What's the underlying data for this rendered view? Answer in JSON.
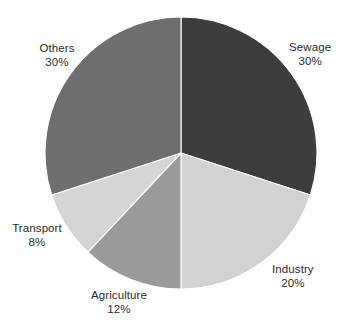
{
  "chart_data": {
    "type": "pie",
    "title": "",
    "subtitle": "",
    "xlabel": "",
    "ylabel": "",
    "legend_position": "none",
    "grid": false,
    "units": "percent",
    "total": 100,
    "start_angle_deg": 0,
    "direction": "clockwise",
    "categories": [
      "Sewage",
      "Industry",
      "Agriculture",
      "Transport",
      "Others"
    ],
    "values": [
      30,
      20,
      12,
      8,
      30
    ],
    "slices": [
      {
        "label": "Sewage",
        "value": 30,
        "value_text": "30%",
        "color": "#3d3d3d",
        "start_deg": 0,
        "end_deg": 108,
        "label_x": 289,
        "label_y": 40,
        "label_anchor": "start"
      },
      {
        "label": "Industry",
        "value": 20,
        "value_text": "20%",
        "color": "#d2d2d2",
        "start_deg": 108,
        "end_deg": 180,
        "label_x": 272,
        "label_y": 262,
        "label_anchor": "start"
      },
      {
        "label": "Agriculture",
        "value": 12,
        "value_text": "12%",
        "color": "#9a9a9a",
        "start_deg": 180,
        "end_deg": 223.2,
        "label_x": 119,
        "label_y": 288,
        "label_anchor": "mid"
      },
      {
        "label": "Transport",
        "value": 8,
        "value_text": "8%",
        "color": "#d5d5d5",
        "start_deg": 223.2,
        "end_deg": 252,
        "label_x": 37,
        "label_y": 221,
        "label_anchor": "mid"
      },
      {
        "label": "Others",
        "value": 30,
        "value_text": "30%",
        "color": "#6e6e6e",
        "start_deg": 252,
        "end_deg": 360,
        "label_x": 57,
        "label_y": 41,
        "label_anchor": "mid"
      }
    ],
    "geometry": {
      "center_x": 181,
      "center_y": 153,
      "radius": 136
    },
    "colors": {
      "background": "#ffffff",
      "slice_border": "#ffffff",
      "label_text": "#2b2b2b"
    }
  }
}
